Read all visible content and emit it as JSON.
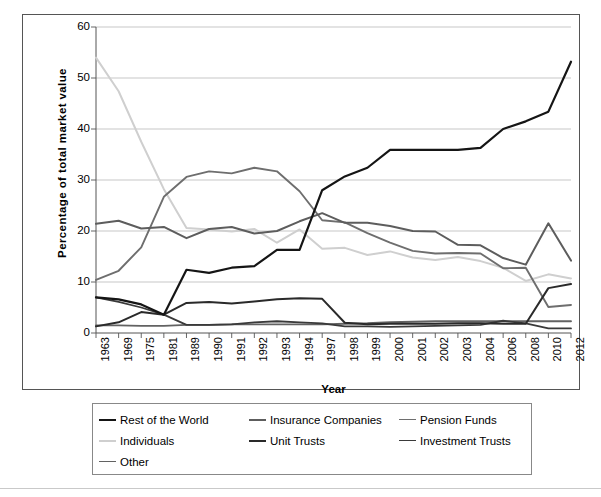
{
  "chart_data": {
    "type": "line",
    "title": "",
    "xlabel": "Year",
    "ylabel": "Percentage of total market value",
    "ylim": [
      0,
      60
    ],
    "y_ticks": [
      0,
      10,
      20,
      30,
      40,
      50,
      60
    ],
    "grid": "horizontal",
    "legend_position": "bottom",
    "categories": [
      "1963",
      "1969",
      "1975",
      "1981",
      "1989",
      "1990",
      "1991",
      "1992",
      "1993",
      "1994",
      "1997",
      "1998",
      "1999",
      "2000",
      "2001",
      "2002",
      "2003",
      "2004",
      "2006",
      "2008",
      "2010",
      "2012"
    ],
    "series": [
      {
        "name": "Rest of the World",
        "color": "#151515",
        "width": 2.2,
        "values": [
          7.0,
          6.6,
          5.6,
          3.6,
          12.4,
          11.8,
          12.8,
          13.1,
          16.3,
          16.3,
          28.0,
          30.7,
          32.4,
          35.9,
          35.9,
          35.9,
          35.9,
          36.3,
          40.0,
          41.5,
          43.4,
          53.2
        ]
      },
      {
        "name": "Insurance Companies",
        "color": "#5d5d5d",
        "width": 2.0,
        "values": [
          21.4,
          22.0,
          20.5,
          20.8,
          18.6,
          20.4,
          20.8,
          19.5,
          20.0,
          21.9,
          23.5,
          21.6,
          21.6,
          21.0,
          20.0,
          19.9,
          17.3,
          17.2,
          14.7,
          13.4,
          21.5,
          14.2
        ]
      },
      {
        "name": "Pension Funds",
        "color": "#6e6e6e",
        "width": 1.9,
        "values": [
          10.4,
          12.2,
          16.8,
          26.7,
          30.6,
          31.7,
          31.3,
          32.4,
          31.7,
          27.8,
          22.1,
          21.7,
          19.6,
          17.7,
          16.1,
          15.6,
          15.7,
          15.6,
          12.7,
          12.8,
          5.1,
          5.5
        ]
      },
      {
        "name": "Individuals",
        "color": "#cfcfcf",
        "width": 2.0,
        "values": [
          54.0,
          47.4,
          37.5,
          28.2,
          20.6,
          20.3,
          19.9,
          20.4,
          17.7,
          20.3,
          16.5,
          16.7,
          15.3,
          16.0,
          14.8,
          14.3,
          14.9,
          14.1,
          12.8,
          10.2,
          11.5,
          10.7
        ]
      },
      {
        "name": "Unit Trusts",
        "color": "#2a2a2a",
        "width": 2.0,
        "values": [
          1.3,
          2.1,
          4.1,
          3.6,
          5.9,
          6.1,
          5.8,
          6.2,
          6.6,
          6.8,
          6.7,
          2.0,
          1.7,
          1.8,
          1.8,
          1.8,
          1.9,
          1.9,
          1.8,
          1.8,
          8.8,
          9.6
        ]
      },
      {
        "name": "Investment Trusts",
        "color": "#3a3a3a",
        "width": 1.8,
        "values": [
          7.0,
          6.1,
          5.0,
          3.6,
          1.6,
          1.6,
          1.7,
          2.1,
          2.3,
          2.1,
          1.9,
          1.3,
          1.3,
          1.2,
          1.3,
          1.4,
          1.5,
          1.6,
          2.4,
          1.9,
          0.9,
          0.9
        ]
      },
      {
        "name": "Other",
        "color": "#626262",
        "width": 1.9,
        "values": [
          1.5,
          1.5,
          1.4,
          1.4,
          1.6,
          1.6,
          1.7,
          1.7,
          1.7,
          1.7,
          1.7,
          1.8,
          1.9,
          2.1,
          2.2,
          2.3,
          2.3,
          2.3,
          2.3,
          2.3,
          2.3,
          2.3
        ]
      }
    ]
  },
  "legend": {
    "items": [
      {
        "label": "Rest of the World",
        "color": "#151515",
        "width": 2.4
      },
      {
        "label": "Insurance Companies",
        "color": "#5d5d5d",
        "width": 2.0
      },
      {
        "label": "Pension Funds",
        "color": "#6e6e6e",
        "width": 1.8
      },
      {
        "label": "Individuals",
        "color": "#cfcfcf",
        "width": 2.0
      },
      {
        "label": "Unit Trusts",
        "color": "#2a2a2a",
        "width": 2.2
      },
      {
        "label": "Investment Trusts",
        "color": "#3a3a3a",
        "width": 1.8
      },
      {
        "label": "Other",
        "color": "#626262",
        "width": 1.9
      }
    ]
  },
  "axes": {
    "y_title": "Percentage of total market value",
    "x_title": "Year"
  }
}
